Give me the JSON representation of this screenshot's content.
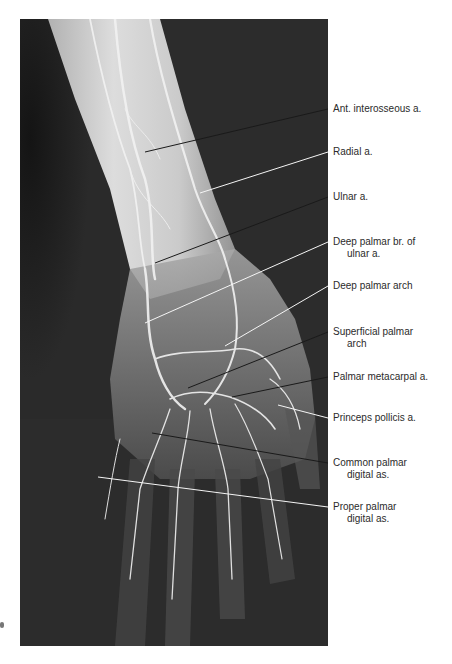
{
  "figure": {
    "type": "angiogram",
    "background_color": "#2a2a2a",
    "vessel_color": "#e8e8e8"
  },
  "labels": [
    {
      "id": "ant-interosseous",
      "line1": "Ant. interosseous a.",
      "line2": "",
      "top": 103,
      "leader": {
        "x1": 145,
        "y1": 152,
        "x2": 328,
        "y2": 109
      }
    },
    {
      "id": "radial",
      "line1": "Radial a.",
      "line2": "",
      "top": 146,
      "leader": {
        "x1": 200,
        "y1": 193,
        "x2": 328,
        "y2": 152
      }
    },
    {
      "id": "ulnar",
      "line1": "Ulnar a.",
      "line2": "",
      "top": 191,
      "leader": {
        "x1": 155,
        "y1": 263,
        "x2": 328,
        "y2": 197
      }
    },
    {
      "id": "deep-palmar-br",
      "line1": "Deep palmar br. of",
      "line2": "ulnar a.",
      "top": 236,
      "leader": {
        "x1": 145,
        "y1": 323,
        "x2": 328,
        "y2": 242
      }
    },
    {
      "id": "deep-palmar-arch",
      "line1": "Deep palmar arch",
      "line2": "",
      "top": 280,
      "leader": {
        "x1": 225,
        "y1": 346,
        "x2": 328,
        "y2": 286
      }
    },
    {
      "id": "superficial-palmar-arch",
      "line1": "Superficial palmar",
      "line2": "arch",
      "top": 326,
      "leader": {
        "x1": 188,
        "y1": 388,
        "x2": 328,
        "y2": 332
      }
    },
    {
      "id": "palmar-metacarpal",
      "line1": "Palmar metacarpal a.",
      "line2": "",
      "top": 371,
      "leader": {
        "x1": 232,
        "y1": 397,
        "x2": 328,
        "y2": 377
      }
    },
    {
      "id": "princeps-pollicis",
      "line1": "Princeps pollicis a.",
      "line2": "",
      "top": 412,
      "leader": {
        "x1": 278,
        "y1": 405,
        "x2": 328,
        "y2": 418
      }
    },
    {
      "id": "common-palmar-digital",
      "line1": "Common palmar",
      "line2": "digital as.",
      "top": 457,
      "leader": {
        "x1": 152,
        "y1": 433,
        "x2": 328,
        "y2": 463
      }
    },
    {
      "id": "proper-palmar-digital",
      "line1": "Proper palmar",
      "line2": "digital as.",
      "top": 501,
      "leader": {
        "x1": 98,
        "y1": 477,
        "x2": 328,
        "y2": 507
      }
    }
  ]
}
